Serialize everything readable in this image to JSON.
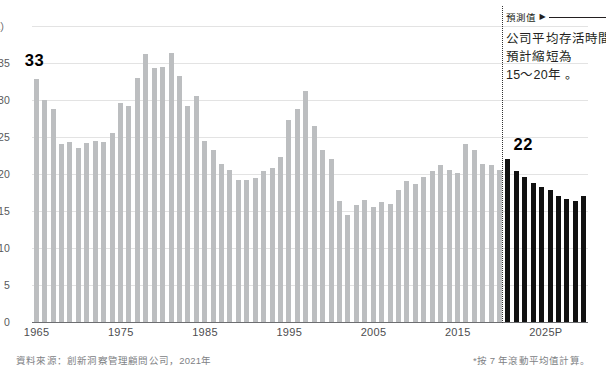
{
  "chart_data": {
    "type": "bar",
    "title": "",
    "xlabel": "",
    "ylabel": "",
    "y_unit_label": "40（年）",
    "ylim": [
      0,
      40
    ],
    "yticks": [
      0,
      5,
      10,
      15,
      20,
      25,
      30,
      35,
      40
    ],
    "ytick_labels": [
      "0",
      "5",
      "10",
      "15",
      "20",
      "25",
      "30",
      "35",
      "40"
    ],
    "grid": true,
    "legend": "none",
    "xticks": [
      1965,
      1975,
      1985,
      1995,
      2005,
      2015,
      2025
    ],
    "xtick_labels": [
      "1965",
      "1975",
      "1985",
      "1995",
      "2005",
      "2015",
      "2025P"
    ],
    "series": [
      {
        "name": "歷史值",
        "color": "#bcbec0",
        "x": [
          1965,
          1966,
          1967,
          1968,
          1969,
          1970,
          1971,
          1972,
          1973,
          1974,
          1975,
          1976,
          1977,
          1978,
          1979,
          1980,
          1981,
          1982,
          1983,
          1984,
          1985,
          1986,
          1987,
          1988,
          1989,
          1990,
          1991,
          1992,
          1993,
          1994,
          1995,
          1996,
          1997,
          1998,
          1999,
          2000,
          2001,
          2002,
          2003,
          2004,
          2005,
          2006,
          2007,
          2008,
          2009,
          2010,
          2011,
          2012,
          2013,
          2014,
          2015,
          2016,
          2017,
          2018,
          2019,
          2020
        ],
        "values": [
          32.8,
          30.0,
          28.8,
          24.0,
          24.3,
          23.5,
          24.2,
          24.5,
          24.3,
          25.6,
          29.6,
          29.2,
          33.0,
          36.2,
          34.3,
          34.5,
          36.3,
          33.2,
          29.2,
          30.6,
          24.5,
          23.3,
          21.3,
          20.5,
          19.2,
          19.2,
          19.5,
          20.4,
          20.8,
          22.3,
          27.3,
          28.8,
          31.2,
          26.5,
          23.2,
          22.0,
          16.3,
          14.5,
          15.8,
          16.5,
          15.6,
          16.2,
          16.0,
          17.8,
          19.0,
          18.6,
          19.6,
          20.4,
          21.2,
          20.5,
          20.2,
          24.0,
          23.2,
          21.3,
          21.2,
          20.5
        ]
      },
      {
        "name": "預測值",
        "color": "#111111",
        "x": [
          2021,
          2022,
          2023,
          2024,
          2025,
          2026,
          2027,
          2028,
          2029,
          2030
        ],
        "values": [
          22.0,
          20.4,
          19.6,
          18.8,
          18.3,
          17.8,
          17.0,
          16.6,
          16.4,
          17.0
        ]
      }
    ],
    "annotations": [
      {
        "name": "history-peak-callout",
        "label": "33",
        "value": 33
      },
      {
        "name": "forecast-start-callout",
        "label": "22",
        "value": 22
      }
    ]
  },
  "axis": {
    "y_unit": "40（年）",
    "ticks": [
      {
        "label": "40（年）",
        "value": 40
      },
      {
        "label": "35",
        "value": 35
      },
      {
        "label": "30",
        "value": 30
      },
      {
        "label": "25",
        "value": 25
      },
      {
        "label": "20",
        "value": 20
      },
      {
        "label": "15",
        "value": 15
      },
      {
        "label": "10",
        "value": 10
      },
      {
        "label": "5",
        "value": 5
      },
      {
        "label": "0",
        "value": 0
      }
    ],
    "xticks": [
      {
        "label": "1965",
        "value": 1965
      },
      {
        "label": "1975",
        "value": 1975
      },
      {
        "label": "1985",
        "value": 1985
      },
      {
        "label": "1995",
        "value": 1995
      },
      {
        "label": "2005",
        "value": 2005
      },
      {
        "label": "2015",
        "value": 2015
      },
      {
        "label": "2025P",
        "value": 2025
      }
    ]
  },
  "callouts": {
    "peak": "33",
    "forecast": "22"
  },
  "annotation": {
    "head_label": "預測值",
    "arrow": "▶",
    "lines": [
      "公司平均存活時間",
      "預計縮短為",
      "15～20年 。"
    ]
  },
  "notes": {
    "source": "資料來源：創新洞察管理顧問公司，2021年",
    "method": "*按 7 年滾動平均值計算。"
  }
}
